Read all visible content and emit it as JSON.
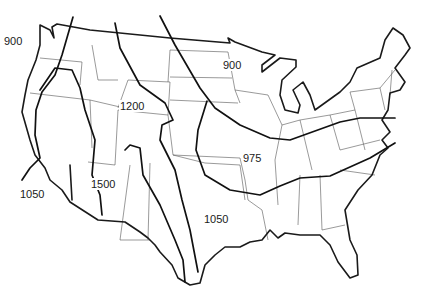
{
  "map": {
    "region": "Contiguous United States",
    "type": "isoline map",
    "colors": {
      "background": "#ffffff",
      "lines": "#1a1a1a"
    }
  },
  "labels": [
    {
      "id": "west-coast-north",
      "text": "900",
      "x": 16,
      "y": 40
    },
    {
      "id": "great-basin-north",
      "text": "1200",
      "x": 120,
      "y": 103
    },
    {
      "id": "upper-midwest",
      "text": "900",
      "x": 224,
      "y": 62
    },
    {
      "id": "midwest",
      "text": "975",
      "x": 243,
      "y": 153
    },
    {
      "id": "california-south",
      "text": "1050",
      "x": 19,
      "y": 188
    },
    {
      "id": "southwest",
      "text": "1500",
      "x": 91,
      "y": 179
    },
    {
      "id": "south-central",
      "text": "1050",
      "x": 204,
      "y": 214
    }
  ]
}
